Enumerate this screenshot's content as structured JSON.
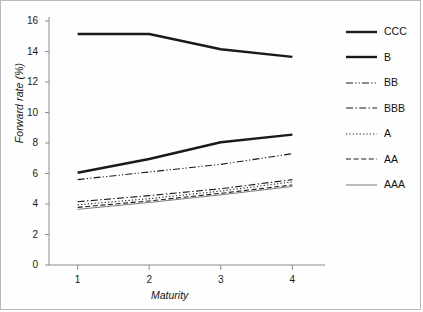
{
  "chart_data": {
    "type": "line",
    "title": "",
    "xlabel": "Maturity",
    "ylabel": "Forward rate (%)",
    "x": [
      1,
      2,
      3,
      4
    ],
    "xticklabels": [
      "1",
      "2",
      "3",
      "4"
    ],
    "yticklabels": [
      "0",
      "2",
      "4",
      "6",
      "8",
      "10",
      "12",
      "14",
      "16"
    ],
    "ytickvalues": [
      0,
      2,
      4,
      6,
      8,
      10,
      12,
      14,
      16
    ],
    "xlim": [
      0.6,
      4.4
    ],
    "ylim": [
      0,
      16
    ],
    "grid": false,
    "legend_position": "right-outside",
    "series": [
      {
        "name": "CCC",
        "values": [
          15.15,
          15.15,
          14.15,
          13.65
        ],
        "style": "solid",
        "width": 2.4,
        "color": "#1a1a1a",
        "dash": ""
      },
      {
        "name": "B",
        "values": [
          6.05,
          6.95,
          8.05,
          8.55
        ],
        "style": "solid",
        "width": 2.4,
        "color": "#1a1a1a",
        "dash": ""
      },
      {
        "name": "BB",
        "values": [
          5.6,
          6.1,
          6.6,
          7.3
        ],
        "style": "dash-dot-dot",
        "width": 1.1,
        "color": "#1a1a1a",
        "dash": "7,2.2,1.2,2.2,1.2,2.2"
      },
      {
        "name": "BBB",
        "values": [
          4.15,
          4.55,
          5.0,
          5.6
        ],
        "style": "dash-dot",
        "width": 1.1,
        "color": "#1a1a1a",
        "dash": "7,2.4,1.4,2.4"
      },
      {
        "name": "A",
        "values": [
          3.95,
          4.35,
          4.85,
          5.45
        ],
        "style": "dotted",
        "width": 1.1,
        "color": "#1a1a1a",
        "dash": "1.2,2.2"
      },
      {
        "name": "AA",
        "values": [
          3.78,
          4.2,
          4.7,
          5.25
        ],
        "style": "dashed",
        "width": 1.1,
        "color": "#1a1a1a",
        "dash": "5,2.6"
      },
      {
        "name": "AAA",
        "values": [
          3.65,
          4.1,
          4.6,
          5.15
        ],
        "style": "solid",
        "width": 0.9,
        "color": "#6e6e6e",
        "dash": ""
      }
    ]
  },
  "axes": {
    "axis_color": "#8c8c8c",
    "tick_color": "#8c8c8c",
    "text_color": "#1a1a1a"
  },
  "figure": {
    "border_color": "#b9b9b9",
    "background": "#fefefe"
  }
}
